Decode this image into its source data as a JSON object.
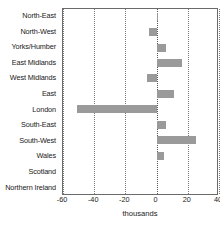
{
  "chart_data": {
    "type": "bar",
    "orientation": "horizontal",
    "title": "",
    "subtitle": "",
    "xlabel": "thousands",
    "ylabel": "",
    "categories": [
      "North-East",
      "North-West",
      "Yorks/Humber",
      "East Midlands",
      "West Midlands",
      "East",
      "London",
      "South-East",
      "South-West",
      "Wales",
      "Scotland",
      "Northern Ireland"
    ],
    "values": [
      1,
      -5,
      6,
      16,
      -6,
      11,
      -51,
      6,
      25,
      5,
      0,
      0
    ],
    "series": [
      {
        "name": "Net internal migration",
        "values": [
          1,
          -5,
          6,
          16,
          -6,
          11,
          -51,
          6,
          25,
          5,
          0,
          0
        ]
      }
    ],
    "xlim": [
      -60,
      40
    ],
    "xticks": [
      -60,
      -40,
      -20,
      0,
      20,
      40
    ],
    "xticklabels": [
      "-60",
      "-40",
      "-20",
      "0",
      "20",
      "40"
    ],
    "grid": "vertical-dotted",
    "legend": "none",
    "bar_color": "#9a9a9a",
    "axis_color": "#6b6b6b",
    "gridline_color": "#7a7a7a",
    "text_color": "#1a1a1a",
    "units": "thousands"
  }
}
